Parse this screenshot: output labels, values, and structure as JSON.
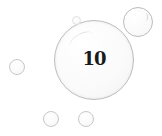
{
  "main_bubble": {
    "label": "10"
  },
  "colors": {
    "background": "#ffffff",
    "bubble_outline": "#c0c0c0",
    "text": "#1a1a1a"
  }
}
